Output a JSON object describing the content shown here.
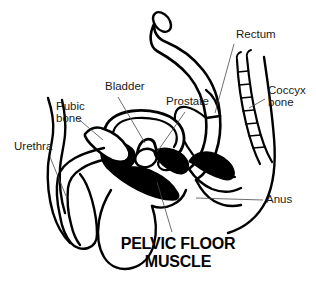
{
  "diagram": {
    "title_line1": "PELVIC FLOOR",
    "title_line2": "MUSCLE",
    "background_color": "#ffffff",
    "ink_color": "#000000",
    "leader_color": "#4a4a4a",
    "labels": [
      {
        "id": "rectum",
        "text": "Rectum",
        "text2": "",
        "x": 236,
        "y": 38,
        "anchor": "start"
      },
      {
        "id": "coccyx",
        "text": "Coccyx",
        "text2": "bone",
        "x": 268,
        "y": 94,
        "anchor": "start"
      },
      {
        "id": "bladder",
        "text": "Bladder",
        "text2": "",
        "x": 105,
        "y": 90,
        "anchor": "start"
      },
      {
        "id": "prostate",
        "text": "Prostate",
        "text2": "",
        "x": 166,
        "y": 105,
        "anchor": "start"
      },
      {
        "id": "pubic-bone",
        "text": "Pubic",
        "text2": "bone",
        "x": 56,
        "y": 110,
        "anchor": "start"
      },
      {
        "id": "urethra",
        "text": "Urethra",
        "text2": "",
        "x": 14,
        "y": 150,
        "anchor": "start"
      },
      {
        "id": "anus",
        "text": "Anus",
        "text2": "",
        "x": 266,
        "y": 203,
        "anchor": "start"
      }
    ],
    "structures": [
      {
        "id": "sigmoid-colon",
        "name": "sigmoid-colon"
      },
      {
        "id": "rectum-body",
        "name": "rectum"
      },
      {
        "id": "coccyx-bone",
        "name": "coccyx-bone"
      },
      {
        "id": "bladder-body",
        "name": "bladder"
      },
      {
        "id": "prostate-gland",
        "name": "prostate"
      },
      {
        "id": "pubic-bone-body",
        "name": "pubic-bone"
      },
      {
        "id": "urethra-channel",
        "name": "urethra"
      },
      {
        "id": "anal-sphincter",
        "name": "anal-sphincter"
      },
      {
        "id": "pelvic-floor-muscle",
        "name": "pelvic-floor-muscle"
      },
      {
        "id": "scrotum",
        "name": "scrotum"
      },
      {
        "id": "abdominal-wall",
        "name": "abdominal-wall"
      },
      {
        "id": "buttock-contour",
        "name": "buttock-contour"
      }
    ]
  }
}
